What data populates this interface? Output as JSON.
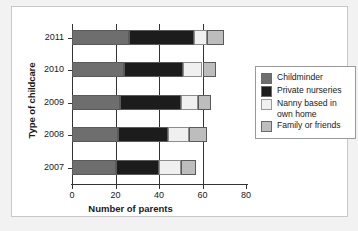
{
  "chart_data": {
    "type": "bar",
    "orientation": "horizontal",
    "stacked": true,
    "title": "",
    "xlabel": "Number of parents",
    "ylabel": "Type of childcare",
    "categories": [
      "2011",
      "2010",
      "2009",
      "2008",
      "2007"
    ],
    "xlim": [
      0,
      80
    ],
    "xticks": [
      0,
      20,
      40,
      60,
      80
    ],
    "xticklabels": [
      "0",
      "20",
      "40",
      "60",
      "80"
    ],
    "grid": "vertical",
    "legend_position": "right",
    "series": [
      {
        "name": "Childminder",
        "color": "#6e6e6e",
        "values": [
          26,
          24,
          22,
          21,
          20
        ]
      },
      {
        "name": "Private nurseries",
        "color": "#1c1c1c",
        "values": [
          30,
          27,
          28,
          23,
          20
        ]
      },
      {
        "name": "Nanny based in\nown home",
        "color": "#f0f0f0",
        "values": [
          6,
          9,
          8,
          10,
          10
        ]
      },
      {
        "name": "Family or friends",
        "color": "#bdbdbd",
        "values": [
          8,
          6,
          6,
          8,
          7
        ]
      }
    ],
    "totals": [
      70,
      66,
      64,
      62,
      57
    ]
  },
  "legend": {
    "items": [
      {
        "label": "Childminder",
        "color": "#6e6e6e"
      },
      {
        "label": "Private nurseries",
        "color": "#1c1c1c"
      },
      {
        "label": "Nanny based in\nown home",
        "color": "#f0f0f0"
      },
      {
        "label": "Family or friends",
        "color": "#bdbdbd"
      }
    ]
  }
}
